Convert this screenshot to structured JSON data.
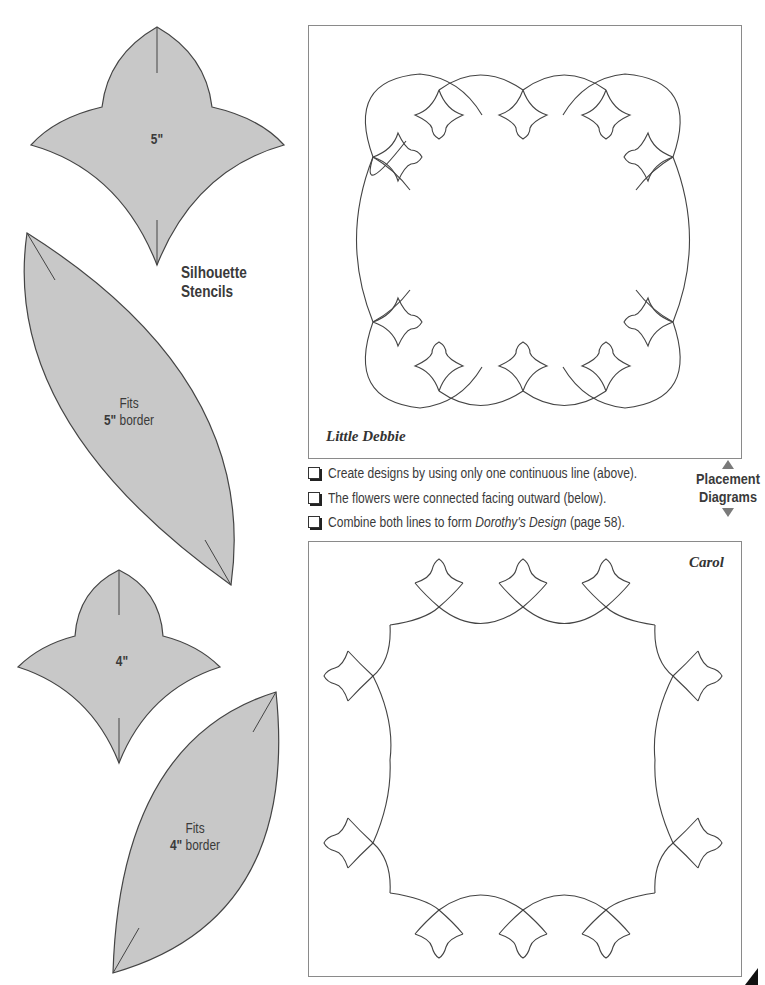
{
  "stencils": {
    "title_line1": "Silhouette",
    "title_line2": "Stencils",
    "fill_color": "#c8c8c8",
    "outline_color": "#444444",
    "flower_5": {
      "label": "5\""
    },
    "leaf_5": {
      "line1": "Fits",
      "size": "5\"",
      "suffix": " border"
    },
    "flower_4": {
      "label": "4\""
    },
    "leaf_4": {
      "line1": "Fits",
      "size": "4\"",
      "suffix": " border"
    }
  },
  "diagrams": {
    "top": {
      "name": "Little Debbie"
    },
    "bottom": {
      "name": "Carol"
    },
    "line_color": "#444444",
    "border_color": "#8a8a8a"
  },
  "checklist": [
    {
      "text": "Create designs by using only one continuous line (above).",
      "checked": false
    },
    {
      "text": "The flowers were connected facing outward (below).",
      "checked": false
    },
    {
      "pre": "Combine both lines to form ",
      "italic": "Dorothy's Design",
      "post": " (page 58).",
      "checked": false
    }
  ],
  "placement": {
    "line1": "Placement",
    "line2": "Diagrams",
    "arrow_up": "triangle-up",
    "arrow_down": "triangle-down",
    "arrow_color": "#7a7a7a"
  }
}
